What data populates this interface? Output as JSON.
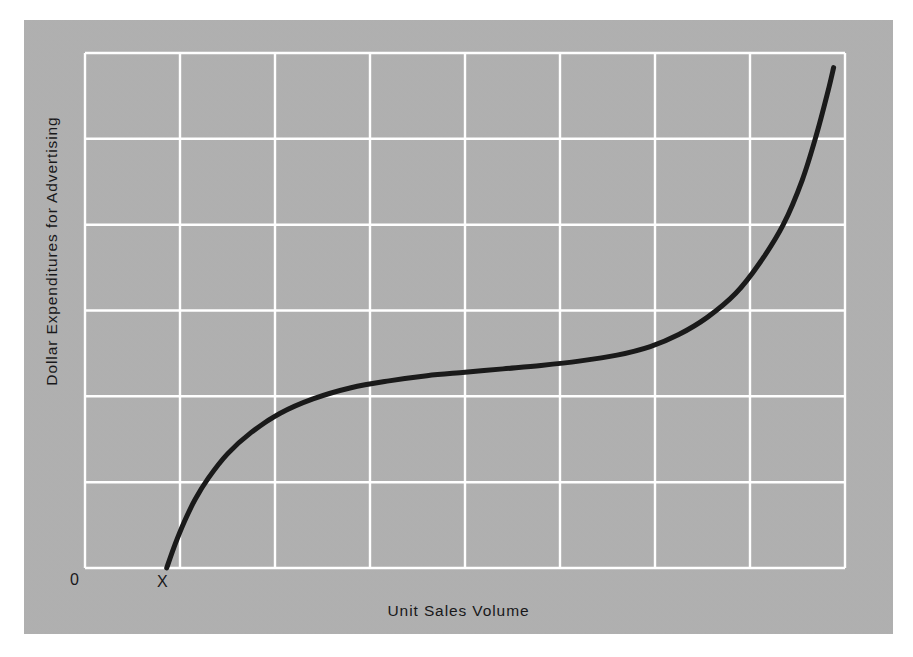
{
  "figure": {
    "background_color": "#ffffff",
    "panel_color": "#b1b1b1",
    "grid_color": "#ffffff",
    "curve_color": "#1a1a1a"
  },
  "labels": {
    "y_axis_title": "Dollar Expenditures for Advertising",
    "x_axis_title": "Unit Sales Volume",
    "origin": "0",
    "threshold_marker": "X"
  },
  "chart_data": {
    "type": "line",
    "title": "",
    "subtitle": "",
    "xlabel": "Unit Sales Volume",
    "ylabel": "Dollar Expenditures for Advertising",
    "xlim": [
      0,
      8
    ],
    "ylim": [
      0,
      6
    ],
    "grid": true,
    "grid_x_divisions": 8,
    "grid_y_divisions": 6,
    "xticks": [
      0,
      1,
      2,
      3,
      4,
      5,
      6,
      7,
      8
    ],
    "yticks": [
      0,
      1,
      2,
      3,
      4,
      5,
      6
    ],
    "xticklabels": [
      "",
      "",
      "",
      "",
      "",
      "",
      "",
      "",
      ""
    ],
    "yticklabels": [
      "",
      "",
      "",
      "",
      "",
      "",
      ""
    ],
    "legend": null,
    "legend_position": "none",
    "annotations": [
      {
        "text": "0",
        "x": 0,
        "y": 0,
        "note": "origin label below axis"
      },
      {
        "text": "X",
        "x": 0.86,
        "y": 0,
        "note": "threshold where curve begins on the x-axis"
      }
    ],
    "series": [
      {
        "name": "Advertising expenditure response curve",
        "color": "#1a1a1a",
        "line_width": 5,
        "x": [
          0.86,
          0.95,
          1.05,
          1.16,
          1.3,
          1.5,
          1.75,
          2.05,
          2.4,
          2.8,
          3.2,
          3.6,
          4.0,
          4.4,
          4.8,
          5.2,
          5.6,
          5.95,
          6.25,
          6.55,
          6.85,
          7.1,
          7.35,
          7.55,
          7.7,
          7.82,
          7.88
        ],
        "y": [
          0.0,
          0.28,
          0.55,
          0.8,
          1.05,
          1.33,
          1.58,
          1.8,
          1.97,
          2.1,
          2.18,
          2.24,
          2.28,
          2.32,
          2.36,
          2.41,
          2.48,
          2.58,
          2.72,
          2.92,
          3.2,
          3.55,
          4.0,
          4.52,
          5.05,
          5.55,
          5.83
        ]
      }
    ]
  }
}
